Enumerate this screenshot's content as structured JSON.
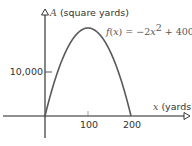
{
  "chart_data": {
    "type": "line",
    "title": "",
    "xlabel_var": "x",
    "xlabel_unit": " (yards)",
    "ylabel_var": "A",
    "ylabel_unit": " (square yards)",
    "function_label": "f(x) = −2x² + 400x",
    "function_parts": {
      "f": "f",
      "open": "(",
      "x": "x",
      "close": ") = −2",
      "x2": "x",
      "sup": "2",
      "plus": " + 400",
      "x3": "x"
    },
    "x_ticks": [
      100,
      200
    ],
    "x_tick_labels": [
      "100",
      "200"
    ],
    "y_ticks": [
      10000
    ],
    "y_tick_labels": [
      "10,000"
    ],
    "xlim": [
      -100,
      330
    ],
    "ylim": [
      -5000,
      24000
    ],
    "grid": false,
    "legend": "none",
    "series": [
      {
        "name": "f(x) = -2x^2 + 400x",
        "x": [
          0,
          20,
          40,
          60,
          80,
          100,
          120,
          140,
          160,
          180,
          200
        ],
        "y": [
          0,
          7200,
          12800,
          16800,
          19200,
          20000,
          19200,
          16800,
          12800,
          7200,
          0
        ]
      }
    ],
    "vertex": {
      "x": 100,
      "y": 20000
    },
    "zeros": [
      0,
      200
    ]
  }
}
